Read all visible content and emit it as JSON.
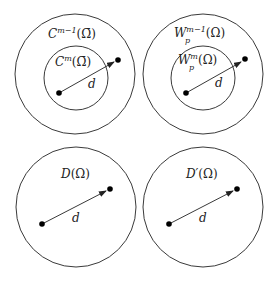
{
  "diagram": {
    "panels": [
      {
        "id": "top-left",
        "outer_label": {
          "base": "C",
          "sup": "m−1",
          "arg": "Ω̄"
        },
        "inner_label": {
          "base": "C",
          "sup": "m",
          "arg": "Ω̄"
        },
        "distance_label": "d"
      },
      {
        "id": "top-right",
        "outer_label": {
          "base": "W",
          "sup": "m−1",
          "sub": "p",
          "arg": "Ω"
        },
        "inner_label": {
          "base": "W",
          "sup": "m",
          "sub": "p",
          "arg": "Ω"
        },
        "distance_label": "d"
      },
      {
        "id": "bottom-left",
        "label": {
          "base": "D",
          "arg": "Ω"
        },
        "distance_label": "d"
      },
      {
        "id": "bottom-right",
        "label": {
          "base": "D′",
          "arg": "Ω"
        },
        "distance_label": "d"
      }
    ],
    "paren_open": "(",
    "paren_close": ")"
  }
}
